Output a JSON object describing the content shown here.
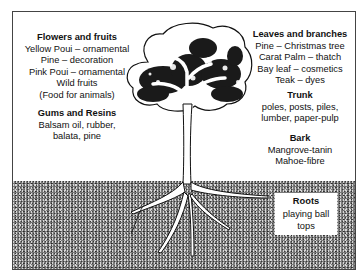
{
  "diagram": {
    "sections": {
      "flowers_fruits": {
        "title": "Flowers and fruits",
        "lines": [
          "Yellow Poui – ornamental",
          "Pine – decoration",
          "Pink Poui – ornamental",
          "Wild fruits",
          "(Food for animals)"
        ]
      },
      "gums_resins": {
        "title": "Gums and Resins",
        "lines": [
          "Balsam oil, rubber,",
          "balata, pine"
        ]
      },
      "leaves_branches": {
        "title": "Leaves and branches",
        "lines": [
          "Pine – Christmas tree",
          "Carat Palm – thatch",
          "Bay leaf – cosmetics",
          "Teak – dyes"
        ]
      },
      "trunk": {
        "title": "Trunk",
        "lines": [
          "poles, posts, piles,",
          "lumber, paper-pulp"
        ]
      },
      "bark": {
        "title": "Bark",
        "lines": [
          "Mangrove-tanin",
          "Mahoe-fibre"
        ]
      },
      "roots": {
        "title": "Roots",
        "lines": [
          "playing ball",
          "tops"
        ]
      }
    },
    "colors": {
      "ink": "#111111",
      "soil": "#7a7a7a",
      "background": "#ffffff"
    }
  }
}
